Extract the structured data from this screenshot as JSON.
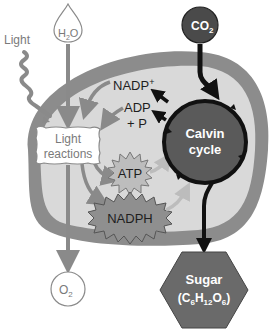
{
  "colors": {
    "membrane": "#8c8c8c",
    "stroma": "#d7d7d7",
    "calvin_fill": "#5a5a5a",
    "co2_fill": "#4a4a4a",
    "sugar_fill": "#6a6a6a",
    "atp_fill": "#bdbdbd",
    "nadph_fill": "#8f8f8f",
    "grey_arrow": "#8a8a8a",
    "black_arrow": "#111111"
  },
  "labels": {
    "light": "Light",
    "h2o": {
      "main": "H",
      "sub": "2",
      "tail": "O"
    },
    "co2": {
      "main": "CO",
      "sub": "2"
    },
    "nadp": {
      "main": "NADP",
      "sup": "+"
    },
    "adp_line1": "ADP",
    "adp_line2": "+ P",
    "light_reactions_line1": "Light",
    "light_reactions_line2": "reactions",
    "calvin_line1": "Calvin",
    "calvin_line2": "cycle",
    "atp": "ATP",
    "nadph": "NADPH",
    "o2": {
      "main": "O",
      "sub": "2"
    },
    "sugar_line1": "Sugar",
    "sugar_formula": {
      "c": "(C",
      "c_sub": "6",
      "h": "H",
      "h_sub": "12",
      "o": "O",
      "o_sub": "6",
      "close": ")"
    }
  }
}
